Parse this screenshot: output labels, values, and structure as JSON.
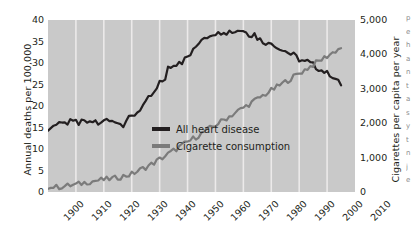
{
  "chart_data": {
    "type": "line",
    "title": "",
    "subtitle": "",
    "xlabel": "",
    "ylabel": "Annual deaths per 100,000",
    "y2label": "Cigarettes per capita per year",
    "grid": "vertical-only",
    "legend_position": "inside-lower-right",
    "xlim": [
      1900,
      2010
    ],
    "xticks": [
      "1900",
      "1910",
      "1920",
      "1930",
      "1940",
      "1950",
      "1960",
      "1970",
      "1980",
      "1990",
      "2000",
      "2010"
    ],
    "ylim": [
      0,
      40
    ],
    "yticks": [
      "0",
      "5",
      "10",
      "15",
      "20",
      "25",
      "30",
      "35",
      "40"
    ],
    "y2lim": [
      0,
      5000
    ],
    "y2ticks": [
      "0",
      "1,000",
      "2,000",
      "3,000",
      "4,000",
      "5,000"
    ],
    "series": [
      {
        "name": "All heart disease",
        "color": "#231f20",
        "axis": "left",
        "units": "annual deaths per 100,000",
        "x": [
          1900,
          1901,
          1902,
          1903,
          1904,
          1905,
          1906,
          1907,
          1908,
          1909,
          1910,
          1911,
          1912,
          1913,
          1914,
          1915,
          1916,
          1917,
          1918,
          1919,
          1920,
          1921,
          1922,
          1923,
          1924,
          1925,
          1926,
          1927,
          1928,
          1929,
          1930,
          1931,
          1932,
          1933,
          1934,
          1935,
          1936,
          1937,
          1938,
          1939,
          1940,
          1941,
          1942,
          1943,
          1944,
          1945,
          1946,
          1947,
          1948,
          1949,
          1950,
          1951,
          1952,
          1953,
          1954,
          1955,
          1956,
          1957,
          1958,
          1959,
          1960,
          1961,
          1962,
          1963,
          1964,
          1965,
          1966,
          1967,
          1968,
          1969,
          1970,
          1971,
          1972,
          1973,
          1974,
          1975,
          1976,
          1977,
          1978,
          1979,
          1980,
          1981,
          1982,
          1983,
          1984,
          1985,
          1986,
          1987,
          1988,
          1989,
          1990,
          1991,
          1992,
          1993,
          1994,
          1995,
          1996,
          1997,
          1998,
          1999,
          2000,
          2001,
          2002,
          2003,
          2004,
          2005
        ],
        "values": [
          14.1,
          15.0,
          15.4,
          15.8,
          16.3,
          16.0,
          16.6,
          15.9,
          16.9,
          16.0,
          16.4,
          16.0,
          16.2,
          16.3,
          16.2,
          15.9,
          16.3,
          16.5,
          15.9,
          15.8,
          16.6,
          16.8,
          16.6,
          17.0,
          16.4,
          16.0,
          16.4,
          15.5,
          16.6,
          17.1,
          17.5,
          18.0,
          18.6,
          19.3,
          20.1,
          20.6,
          21.8,
          22.4,
          22.9,
          24.0,
          25.3,
          25.8,
          26.5,
          28.9,
          28.5,
          29.6,
          29.3,
          30.7,
          30.2,
          31.5,
          32.0,
          31.4,
          33.2,
          33.9,
          34.0,
          35.4,
          36.2,
          36.0,
          36.6,
          36.8,
          37.0,
          36.8,
          37.2,
          37.5,
          37.1,
          37.4,
          37.3,
          37.3,
          37.7,
          37.6,
          37.4,
          37.5,
          36.7,
          36.4,
          36.8,
          35.8,
          35.5,
          35.0,
          34.8,
          34.4,
          34.6,
          34.4,
          33.7,
          33.6,
          33.0,
          32.8,
          32.5,
          32.0,
          31.9,
          31.4,
          30.8,
          30.6,
          30.2,
          30.4,
          29.9,
          29.6,
          29.0,
          28.7,
          28.3,
          28.0,
          27.6,
          27.4,
          26.9,
          26.3,
          25.6,
          25.0
        ]
      },
      {
        "name": "Cigarette consumption",
        "color": "#7b7b7b",
        "axis": "right",
        "units": "cigarettes per capita per year",
        "x": [
          1900,
          1901,
          1902,
          1903,
          1904,
          1905,
          1906,
          1907,
          1908,
          1909,
          1910,
          1911,
          1912,
          1913,
          1914,
          1915,
          1916,
          1917,
          1918,
          1919,
          1920,
          1921,
          1922,
          1923,
          1924,
          1925,
          1926,
          1927,
          1928,
          1929,
          1930,
          1931,
          1932,
          1933,
          1934,
          1935,
          1936,
          1937,
          1938,
          1939,
          1940,
          1941,
          1942,
          1943,
          1944,
          1945,
          1946,
          1947,
          1948,
          1949,
          1950,
          1951,
          1952,
          1953,
          1954,
          1955,
          1956,
          1957,
          1958,
          1959,
          1960,
          1961,
          1962,
          1963,
          1964,
          1965,
          1966,
          1967,
          1968,
          1969,
          1970,
          1971,
          1972,
          1973,
          1974,
          1975,
          1976,
          1977,
          1978,
          1979,
          1980,
          1981,
          1982,
          1983,
          1984,
          1985,
          1986,
          1987,
          1988,
          1989,
          1990,
          1991,
          1992,
          1993,
          1994,
          1995,
          1996,
          1997,
          1998,
          1999,
          2000,
          2001,
          2002,
          2003,
          2004,
          2005
        ],
        "values": [
          110,
          120,
          130,
          140,
          150,
          160,
          170,
          180,
          190,
          200,
          210,
          230,
          250,
          270,
          290,
          300,
          310,
          330,
          340,
          350,
          360,
          370,
          380,
          390,
          400,
          420,
          440,
          460,
          480,
          500,
          520,
          560,
          600,
          640,
          680,
          720,
          760,
          800,
          850,
          900,
          950,
          1000,
          1050,
          1100,
          1150,
          1200,
          1250,
          1300,
          1350,
          1400,
          1450,
          1500,
          1550,
          1600,
          1650,
          1700,
          1750,
          1800,
          1850,
          1900,
          1950,
          2000,
          2050,
          2100,
          2150,
          2200,
          2250,
          2300,
          2350,
          2400,
          2450,
          2500,
          2550,
          2600,
          2650,
          2700,
          2750,
          2800,
          2850,
          2900,
          2950,
          3000,
          3050,
          3100,
          3150,
          3200,
          3250,
          3300,
          3350,
          3400,
          3450,
          3500,
          3550,
          3600,
          3650,
          3700,
          3750,
          3800,
          3850,
          3900,
          3950,
          4000,
          4050,
          4100,
          4150,
          4200
        ]
      }
    ],
    "annotations": []
  },
  "axes": {
    "left": {
      "title": "Annual deaths per 100,000",
      "ticks": [
        "40",
        "35",
        "30",
        "25",
        "20",
        "15",
        "10",
        "5",
        "0"
      ]
    },
    "right": {
      "title": "Cigarettes per capita per year",
      "ticks": [
        "5,000",
        "4,000",
        "3,000",
        "2,000",
        "1,000",
        "0"
      ]
    },
    "bottom": {
      "ticks": [
        "1900",
        "1910",
        "1920",
        "1930",
        "1940",
        "1950",
        "1960",
        "1970",
        "1980",
        "1990",
        "2000",
        "2010"
      ]
    }
  },
  "legend": {
    "items": [
      {
        "label": "All heart disease",
        "color": "#231f20"
      },
      {
        "label": "Cigarette consumption",
        "color": "#7b7b7b"
      }
    ]
  },
  "edge_text": {
    "lines": [
      "p",
      "e",
      "h",
      "a",
      "n",
      "t",
      "a",
      "s",
      "y",
      "t",
      "n",
      "j",
      "e"
    ]
  }
}
